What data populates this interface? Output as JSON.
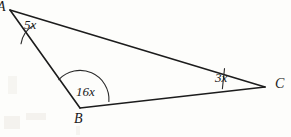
{
  "figure": {
    "kind": "triangle-angle-diagram",
    "background_color": "#fdfdfb",
    "ink_color": "#1c1c1c",
    "width": 291,
    "height": 137
  },
  "vertices": [
    {
      "id": "A",
      "label": "A",
      "x": 10,
      "y": 10,
      "label_truncated": true
    },
    {
      "id": "B",
      "label": "B",
      "x": 80,
      "y": 108,
      "label_truncated": false
    },
    {
      "id": "C",
      "label": "C",
      "x": 265,
      "y": 87,
      "label_truncated": false
    }
  ],
  "edges": [
    {
      "id": "AC",
      "from": "A",
      "to": "C",
      "stroke_width": 1.6
    },
    {
      "id": "AB",
      "from": "A",
      "to": "B",
      "stroke_width": 1.6
    },
    {
      "id": "BC",
      "from": "B",
      "to": "C",
      "stroke_width": 1.6
    }
  ],
  "angles": [
    {
      "vertex": "A",
      "label": "5x",
      "arc": "small",
      "label_x": 24,
      "label_y": 18
    },
    {
      "vertex": "B",
      "label": "16x",
      "arc": "large",
      "label_x": 76,
      "label_y": 85
    },
    {
      "vertex": "C",
      "label": "3x",
      "arc": "narrow",
      "label_x": 215,
      "label_y": 71
    }
  ],
  "geometry": {
    "A": {
      "x": 10,
      "y": 10
    },
    "B": {
      "x": 80,
      "y": 108
    },
    "C": {
      "x": 265,
      "y": 87
    },
    "arc_A": "M 33.5 25.4 A 26 26 0 0 0 21.0 43.8",
    "arc_B": "M 58.8 79.6 A 29 29 0 0 1 108.9 101.5",
    "arc_C": "M 224.5 68.6 L 222.4 88.8",
    "edge_AC": "M 10 10 L 265 87",
    "edge_AB": "M 10 10 L 80 108",
    "edge_BC": "M 80 108 L 265 87"
  }
}
